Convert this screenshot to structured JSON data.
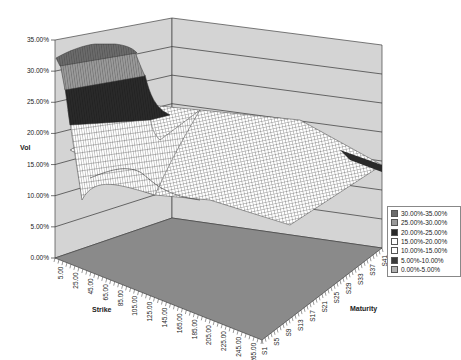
{
  "chart_data": {
    "type": "surface3d",
    "title": "",
    "ylabel": "Vol",
    "xlabel": "Strike",
    "zlabel": "Maturity",
    "vol_axis": {
      "ticks": [
        "0.00%",
        "5.00%",
        "10.00%",
        "15.00%",
        "20.00%",
        "25.00%",
        "30.00%",
        "35.00%"
      ],
      "range": [
        0,
        0.35
      ]
    },
    "strike_axis": {
      "ticks": [
        "5.00",
        "25.00",
        "45.00",
        "65.00",
        "85.00",
        "105.00",
        "125.00",
        "145.00",
        "165.00",
        "185.00",
        "205.00",
        "225.00",
        "245.00",
        "265.00"
      ]
    },
    "maturity_axis": {
      "ticks": [
        "S1",
        "S5",
        "S9",
        "S13",
        "S17",
        "S21",
        "S25",
        "S29",
        "S33",
        "S37",
        "S41"
      ]
    },
    "legend": {
      "position": "right",
      "entries": [
        {
          "label": "30.00%-35.00%",
          "color": "#6b6b6b"
        },
        {
          "label": "25.00%-30.00%",
          "color": "#9a9a9a"
        },
        {
          "label": "20.00%-25.00%",
          "color": "#2a2a2a"
        },
        {
          "label": "15.00%-20.00%",
          "color": "#ffffff"
        },
        {
          "label": "10.00%-15.00%",
          "color": "#ffffff"
        },
        {
          "label": "5.00%-10.00%",
          "color": "#3a3a3a"
        },
        {
          "label": "0.00%-5.00%",
          "color": "#b0b0b0"
        }
      ]
    },
    "surface_description": "Implied volatility surface: ~32% at low strikes/short maturity, dropping steeply to ~15% near mid strikes, flattening to ~12-17% across higher strikes and longer maturities",
    "sample_values": {
      "strikes": [
        5,
        45,
        85,
        125,
        165,
        205,
        245,
        265
      ],
      "maturities": [
        "S1",
        "S21",
        "S41"
      ],
      "vol": [
        [
          0.33,
          0.32,
          0.3,
          0.24,
          0.17,
          0.14,
          0.13,
          0.13
        ],
        [
          0.3,
          0.28,
          0.24,
          0.18,
          0.15,
          0.14,
          0.15,
          0.16
        ],
        [
          0.26,
          0.24,
          0.2,
          0.17,
          0.16,
          0.17,
          0.19,
          0.2
        ]
      ]
    },
    "grid": true
  },
  "colors": {
    "wall": "#d4d4d4",
    "floor": "#8a8a8a",
    "gridline": "#333333"
  }
}
